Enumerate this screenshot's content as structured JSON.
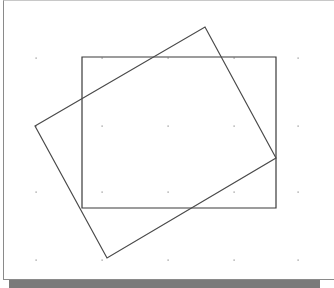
{
  "diagram": {
    "type": "geometry-overlap",
    "canvas": {
      "width": 320,
      "height": 288
    },
    "grid_dots": {
      "xs": [
        36,
        102,
        168,
        234,
        298
      ],
      "ys": [
        58,
        126,
        192,
        260
      ],
      "color": "#8a8a8a"
    },
    "shapes": [
      {
        "name": "axis-aligned-rectangle",
        "points": [
          [
            82,
            57
          ],
          [
            276,
            57
          ],
          [
            276,
            208
          ],
          [
            82,
            208
          ]
        ],
        "stroke": "#3a3a3a"
      },
      {
        "name": "rotated-rectangle",
        "points": [
          [
            35,
            126
          ],
          [
            205,
            27
          ],
          [
            276,
            158
          ],
          [
            107,
            258
          ]
        ],
        "stroke": "#4a4a4a"
      }
    ],
    "colors": {
      "background": "#ffffff",
      "frame_border": "#8a8a8a",
      "shadow": "#7a7a7a"
    }
  }
}
